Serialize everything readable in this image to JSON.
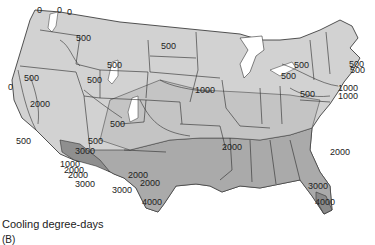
{
  "figure": {
    "caption": "Cooling degree-days",
    "panel_label": "(B)"
  },
  "legend_colors": {
    "zone_0": "#ffffff",
    "zone_500": "#d4d4d4",
    "zone_1000": "#c2c2c2",
    "zone_2000": "#a9a9a9",
    "zone_3000": "#969696",
    "zone_4000": "#8a8a8a",
    "state_border": "#2a2a2a",
    "contour_line": "#333333"
  },
  "contour_labels": [
    {
      "text": "0",
      "x": 37,
      "y": 6
    },
    {
      "text": "0",
      "x": 57,
      "y": 6
    },
    {
      "text": "0",
      "x": 67,
      "y": 8
    },
    {
      "text": "500",
      "x": 76,
      "y": 34
    },
    {
      "text": "500",
      "x": 161,
      "y": 42
    },
    {
      "text": "0",
      "x": 8,
      "y": 83
    },
    {
      "text": "500",
      "x": 24,
      "y": 74
    },
    {
      "text": "2000",
      "x": 30,
      "y": 100
    },
    {
      "text": "500",
      "x": 87,
      "y": 76
    },
    {
      "text": "500",
      "x": 110,
      "y": 120
    },
    {
      "text": "500",
      "x": 16,
      "y": 137
    },
    {
      "text": "3000",
      "x": 75,
      "y": 147
    },
    {
      "text": "500",
      "x": 88,
      "y": 137
    },
    {
      "text": "1000",
      "x": 195,
      "y": 86
    },
    {
      "text": "500",
      "x": 107,
      "y": 61
    },
    {
      "text": "500",
      "x": 294,
      "y": 61
    },
    {
      "text": "500",
      "x": 281,
      "y": 72
    },
    {
      "text": "500",
      "x": 349,
      "y": 60
    },
    {
      "text": "500",
      "x": 350,
      "y": 66
    },
    {
      "text": "500",
      "x": 300,
      "y": 90
    },
    {
      "text": "1000",
      "x": 338,
      "y": 84
    },
    {
      "text": "1000",
      "x": 338,
      "y": 92
    },
    {
      "text": "1000",
      "x": 60,
      "y": 160
    },
    {
      "text": "2000",
      "x": 64,
      "y": 166
    },
    {
      "text": "2000",
      "x": 68,
      "y": 171
    },
    {
      "text": "2000",
      "x": 222,
      "y": 143
    },
    {
      "text": "2000",
      "x": 330,
      "y": 148
    },
    {
      "text": "2000",
      "x": 128,
      "y": 171
    },
    {
      "text": "2000",
      "x": 140,
      "y": 179
    },
    {
      "text": "3000",
      "x": 75,
      "y": 180
    },
    {
      "text": "3000",
      "x": 112,
      "y": 186
    },
    {
      "text": "4000",
      "x": 142,
      "y": 198
    },
    {
      "text": "3000",
      "x": 308,
      "y": 182
    },
    {
      "text": "4000",
      "x": 315,
      "y": 198
    }
  ]
}
